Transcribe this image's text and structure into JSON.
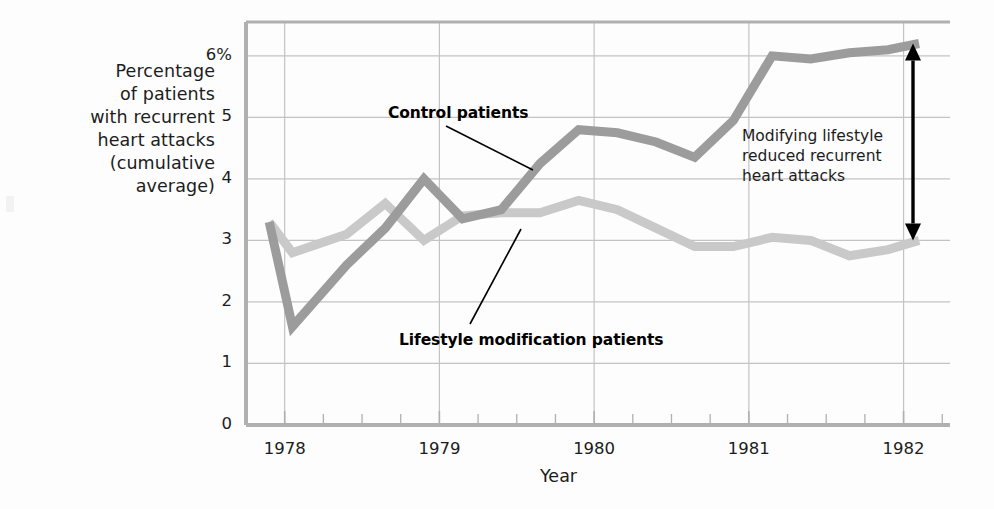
{
  "chart_data": {
    "type": "line",
    "title": "",
    "xlabel": "Year",
    "ylabel": "Percentage of patients with recurrent heart attacks (cumulative average)",
    "ylabel_lines": [
      "Percentage",
      "of patients",
      "with recurrent",
      "heart attacks",
      "(cumulative",
      "average)"
    ],
    "x_tick_labels": [
      "1978",
      "1979",
      "1980",
      "1981",
      "1982"
    ],
    "x_tick_values": [
      1978,
      1979,
      1980,
      1981,
      1982
    ],
    "y_tick_labels": [
      "0",
      "1",
      "2",
      "3",
      "4",
      "5",
      "6%"
    ],
    "y_tick_values": [
      0,
      1,
      2,
      3,
      4,
      5,
      6
    ],
    "xlim": [
      1977.75,
      1982.3
    ],
    "ylim": [
      0,
      6.55
    ],
    "grid": true,
    "legend_position": "inline-annotations",
    "series": [
      {
        "name": "Control patients",
        "color": "#9c9c9c",
        "x": [
          1977.9,
          1978.05,
          1978.4,
          1978.65,
          1978.9,
          1979.15,
          1979.4,
          1979.65,
          1979.9,
          1980.15,
          1980.4,
          1980.65,
          1980.9,
          1981.15,
          1981.4,
          1981.65,
          1981.9,
          1982.1
        ],
        "values": [
          3.3,
          1.6,
          2.6,
          3.2,
          4.0,
          3.35,
          3.5,
          4.25,
          4.8,
          4.75,
          4.6,
          4.35,
          4.95,
          6.0,
          5.95,
          6.05,
          6.1,
          6.2
        ]
      },
      {
        "name": "Lifestyle modification patients",
        "color": "#c9c9c9",
        "x": [
          1977.9,
          1978.05,
          1978.4,
          1978.65,
          1978.9,
          1979.15,
          1979.4,
          1979.65,
          1979.9,
          1980.15,
          1980.4,
          1980.65,
          1980.9,
          1981.15,
          1981.4,
          1981.65,
          1981.9,
          1982.1
        ],
        "values": [
          3.3,
          2.8,
          3.1,
          3.6,
          3.0,
          3.4,
          3.45,
          3.45,
          3.65,
          3.5,
          3.2,
          2.9,
          2.9,
          3.05,
          3.0,
          2.75,
          2.85,
          3.0
        ]
      }
    ],
    "annotations": [
      {
        "name": "control-patients-label",
        "text": "Control patients",
        "x_px": 388,
        "y_px": 104,
        "leader_from": [
          446,
          126
        ],
        "leader_to": [
          533,
          170
        ]
      },
      {
        "name": "lifestyle-modification-patients-label",
        "text": "Lifestyle modification patients",
        "x_px": 399,
        "y_px": 331,
        "leader_from": [
          470,
          324
        ],
        "leader_to": [
          521,
          229
        ]
      },
      {
        "name": "difference-callout",
        "text": "Modifying lifestyle\nreduced recurrent\nheart attacks",
        "arrow_top_value": 6.2,
        "arrow_bottom_value": 3.0
      }
    ]
  },
  "axis": {
    "y_title_lines": "Percentage\nof patients\nwith recurrent\nheart attacks\n(cumulative\naverage)",
    "x_title": "Year"
  },
  "colors": {
    "control_line": "#9c9c9c",
    "lifestyle_line": "#c9c9c9",
    "grid": "#c3c3c3",
    "axis": "#b0b0b0",
    "text": "#1c1c1c",
    "arrow": "#000000"
  }
}
